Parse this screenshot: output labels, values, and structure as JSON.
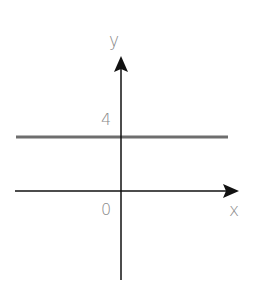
{
  "diagram": {
    "type": "coordinate-plane",
    "axes": {
      "x_label": "x",
      "y_label": "y",
      "origin_label": "0"
    },
    "lines": [
      {
        "equation": "y = 4",
        "y_intercept_label": "4",
        "color": "#6e6e6e"
      }
    ],
    "colors": {
      "axis": "#111111",
      "label": "#8a8a8a"
    }
  }
}
